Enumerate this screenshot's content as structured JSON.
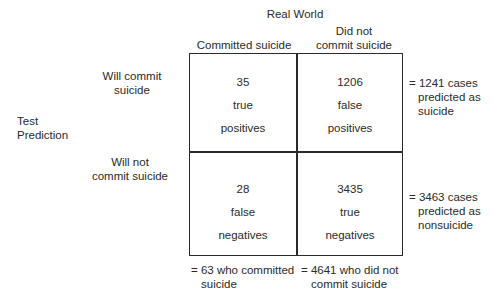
{
  "header": {
    "title": "Real World",
    "col_committed": "Committed suicide",
    "col_not_line1": "Did not",
    "col_not_line2": "commit suicide"
  },
  "rows": {
    "axis_label_line1": "Test",
    "axis_label_line2": "Prediction",
    "will_line1": "Will commit",
    "will_line2": "suicide",
    "willnot_line1": "Will not",
    "willnot_line2": "commit suicide"
  },
  "cells": {
    "tp": {
      "count": "35",
      "line1": "true",
      "line2": "positives"
    },
    "fp": {
      "count": "1206",
      "line1": "false",
      "line2": "positives"
    },
    "fn": {
      "count": "28",
      "line1": "false",
      "line2": "negatives"
    },
    "tn": {
      "count": "3435",
      "line1": "true",
      "line2": "negatives"
    }
  },
  "row_totals": {
    "top_line1": "= 1241 cases",
    "top_line2": "predicted as",
    "top_line3": "suicide",
    "bottom_line1": "= 3463 cases",
    "bottom_line2": "predicted as",
    "bottom_line3": "nonsuicide"
  },
  "col_totals": {
    "left_line1": "= 63 who committed",
    "left_line2": "suicide",
    "right_line1": "= 4641 who did not",
    "right_line2": "commit suicide"
  }
}
